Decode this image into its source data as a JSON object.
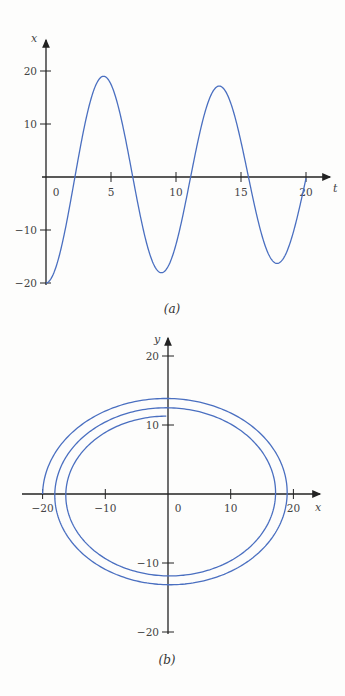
{
  "chart_data": [
    {
      "type": "line",
      "caption": "(a)",
      "title": "",
      "xlabel": "t",
      "ylabel": "x",
      "xlim": [
        0,
        21.5
      ],
      "ylim": [
        -20,
        25
      ],
      "x_ticks": [
        0,
        5,
        10,
        15,
        20
      ],
      "x_tick_labels": [
        "0",
        "5",
        "10",
        "15",
        "20"
      ],
      "y_ticks": [
        20,
        10,
        -10,
        -20
      ],
      "y_tick_labels": [
        "20",
        "10",
        "-10",
        "-20"
      ],
      "grid": false,
      "legend": null,
      "series": [
        {
          "name": "x(t)",
          "color": "#4a6fc0",
          "model": "damped cosine x = -A·exp(-λt)·cos(ωt)",
          "amplitude": 20,
          "omega": 0.706,
          "damping": 0.0115,
          "t_range": [
            0,
            20
          ],
          "key_points": [
            {
              "t": 0,
              "x": -20
            },
            {
              "t": 2.2,
              "x": 0
            },
            {
              "t": 4.5,
              "x": 18.9
            },
            {
              "t": 6.6,
              "x": 0
            },
            {
              "t": 8.9,
              "x": -18.0
            },
            {
              "t": 11.1,
              "x": 0
            },
            {
              "t": 13.3,
              "x": 17.3
            },
            {
              "t": 15.6,
              "x": 0
            },
            {
              "t": 17.6,
              "x": -16.5
            },
            {
              "t": 20,
              "x": 1
            }
          ]
        }
      ]
    },
    {
      "type": "line",
      "caption": "(b)",
      "title": "",
      "xlabel": "x",
      "ylabel": "y",
      "xlim": [
        -22,
        22
      ],
      "ylim": [
        -20,
        24
      ],
      "x_ticks": [
        -20,
        -10,
        0,
        10,
        20
      ],
      "x_tick_labels": [
        "-20",
        "-10",
        "0",
        "10",
        "20"
      ],
      "y_ticks": [
        20,
        10,
        -10,
        -20
      ],
      "y_tick_labels": [
        "20",
        "10",
        "-10",
        "-20"
      ],
      "grid": false,
      "legend": null,
      "series": [
        {
          "name": "phase-plane spiral (x, y)",
          "color": "#4a6fc0",
          "model": "x = -A·exp(-λt)·cos(ωt), y = B·exp(-λt)·sin(ωt)",
          "amplitude_x": 20,
          "amplitude_y": 14.2,
          "omega": 0.706,
          "damping": 0.0115,
          "t_range": [
            0,
            20
          ],
          "key_points": [
            {
              "x": -20,
              "y": 0
            },
            {
              "x": 0,
              "y": 13.5
            },
            {
              "x": 19,
              "y": 0
            },
            {
              "x": 0,
              "y": -13.3
            },
            {
              "x": -18,
              "y": 0
            },
            {
              "x": 0,
              "y": 12.2
            },
            {
              "x": 17.3,
              "y": 0
            },
            {
              "x": 0,
              "y": -12.2
            },
            {
              "x": -16.5,
              "y": 0
            },
            {
              "x": 0,
              "y": 11.2
            }
          ]
        }
      ]
    }
  ]
}
